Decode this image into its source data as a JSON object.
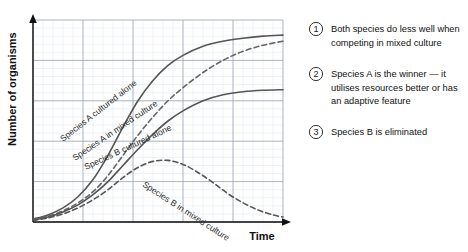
{
  "chart_data": {
    "type": "line",
    "title": "",
    "xlabel": "Time",
    "ylabel": "Number of organisms",
    "xlim": [
      0,
      10
    ],
    "ylim": [
      0,
      10
    ],
    "grid": true,
    "grid_major_x": 5,
    "grid_major_y": 5,
    "grid_minor": true,
    "legend_position": "inline-labels",
    "axis_arrows": true,
    "tick_labels_x": [],
    "tick_labels_y": [],
    "series": [
      {
        "name": "Species A cultured alone",
        "style": "solid",
        "color": "#555555",
        "label_text": "Species A cultured alone",
        "x": [
          0,
          0.6,
          1.2,
          1.8,
          2.4,
          3.0,
          3.6,
          4.2,
          4.8,
          5.4,
          6.0,
          6.8,
          7.6,
          8.4,
          9.2,
          10
        ],
        "y": [
          0.15,
          0.35,
          0.7,
          1.25,
          2.1,
          3.3,
          4.7,
          6.0,
          7.0,
          7.75,
          8.25,
          8.7,
          8.95,
          9.1,
          9.2,
          9.25
        ]
      },
      {
        "name": "Species A in mixed culture",
        "style": "dashed",
        "color": "#666666",
        "label_text": "Species A in mixed culture",
        "x": [
          0,
          0.6,
          1.2,
          1.8,
          2.4,
          3.0,
          3.6,
          4.2,
          4.8,
          5.4,
          6.0,
          6.8,
          7.6,
          8.4,
          9.2,
          10
        ],
        "y": [
          0.12,
          0.28,
          0.55,
          0.95,
          1.5,
          2.3,
          3.3,
          4.3,
          5.2,
          6.0,
          6.65,
          7.4,
          8.0,
          8.45,
          8.75,
          8.95
        ]
      },
      {
        "name": "Species B cultured alone",
        "style": "solid",
        "color": "#555555",
        "label_text": "Species B cultured alone",
        "x": [
          0,
          0.6,
          1.2,
          1.8,
          2.4,
          3.0,
          3.6,
          4.2,
          4.8,
          5.4,
          6.0,
          6.8,
          7.6,
          8.4,
          9.2,
          10
        ],
        "y": [
          0.1,
          0.25,
          0.5,
          0.85,
          1.35,
          2.0,
          2.8,
          3.6,
          4.35,
          5.0,
          5.5,
          6.0,
          6.3,
          6.45,
          6.52,
          6.55
        ]
      },
      {
        "name": "Species B in mixed culture",
        "style": "dashed",
        "color": "#555555",
        "label_text": "Species B in mixed culture",
        "x": [
          0,
          0.6,
          1.2,
          1.8,
          2.4,
          3.0,
          3.6,
          4.2,
          4.8,
          5.4,
          6.0,
          6.6,
          7.2,
          7.8,
          8.4,
          9.0,
          9.6,
          10
        ],
        "y": [
          0.08,
          0.2,
          0.4,
          0.7,
          1.1,
          1.6,
          2.2,
          2.7,
          3.0,
          3.05,
          2.85,
          2.45,
          1.95,
          1.4,
          0.95,
          0.6,
          0.35,
          0.25
        ]
      }
    ]
  },
  "axes": {
    "y_title": "Number of organisms",
    "x_title": "Time"
  },
  "curve_labels": [
    {
      "text": "Species A cultured alone"
    },
    {
      "text": "Species A in mixed culture"
    },
    {
      "text": "Species B cultured alone"
    },
    {
      "text": "Species B in mixed culture"
    }
  ],
  "notes": [
    {
      "marker": "1",
      "text": "Both species do less well when competing in mixed culture"
    },
    {
      "marker": "2",
      "text": "Species A is the winner — it utilises resources better or has an adaptive feature"
    },
    {
      "marker": "3",
      "text": "Species B is eliminated"
    }
  ],
  "notes_lines": [
    {
      "marker": "1",
      "lines": [
        "Both species do less well when",
        "competing in mixed culture"
      ]
    },
    {
      "marker": "2",
      "lines": [
        "Species A is the winner — it",
        "utilises resources better or has",
        "an adaptive feature"
      ]
    },
    {
      "marker": "3",
      "lines": [
        "Species B is eliminated"
      ]
    }
  ],
  "colors": {
    "background": "#ffffff",
    "curve": "#555555",
    "grid_major": "#9aa6b0",
    "grid_minor": "#d7dde2",
    "axis": "#111111",
    "text": "#111111"
  }
}
